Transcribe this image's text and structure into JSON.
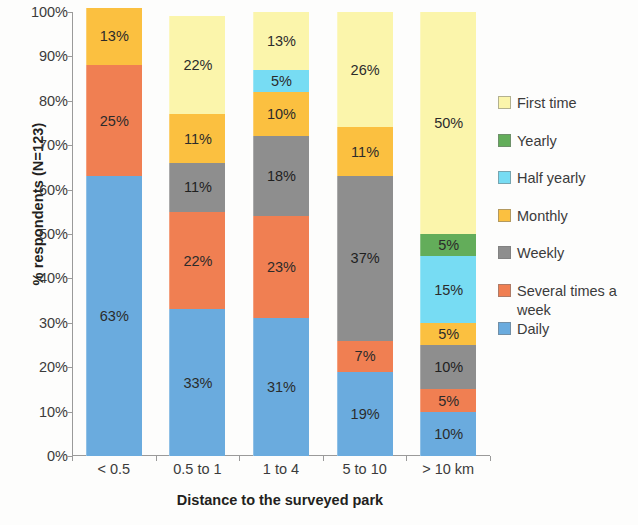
{
  "chart_data": {
    "type": "bar",
    "title": "",
    "subtitle": "",
    "stacked": true,
    "stack_total": 100,
    "xlabel": "Distance to the surveyed park",
    "ylabel": "% respondents (N=123)",
    "categories": [
      "< 0.5",
      "0.5 to 1",
      "1 to 4",
      "5 to 10",
      "> 10 km"
    ],
    "ylim": [
      0,
      100
    ],
    "ytick_labels": [
      "0%",
      "10%",
      "20%",
      "30%",
      "40%",
      "50%",
      "60%",
      "70%",
      "80%",
      "90%",
      "100%"
    ],
    "ytick_values": [
      0,
      10,
      20,
      30,
      40,
      50,
      60,
      70,
      80,
      90,
      100
    ],
    "grid": false,
    "legend_position": "right",
    "value_suffix": "%",
    "series": [
      {
        "name": "Daily",
        "color": "#6aabde",
        "values": [
          63,
          33,
          31,
          19,
          10
        ],
        "labels": [
          "63%",
          "33%",
          "31%",
          "19%",
          "10%"
        ]
      },
      {
        "name": "Several times a week",
        "color": "#f07f52",
        "values": [
          25,
          22,
          23,
          7,
          5
        ],
        "labels": [
          "25%",
          "22%",
          "23%",
          "7%",
          "5%"
        ]
      },
      {
        "name": "Weekly",
        "color": "#8e8e8e",
        "values": [
          0,
          11,
          18,
          37,
          10
        ],
        "labels": [
          "",
          "11%",
          "18%",
          "37%",
          "10%"
        ]
      },
      {
        "name": "Monthly",
        "color": "#fbc040",
        "values": [
          13,
          11,
          10,
          11,
          5
        ],
        "labels": [
          "13%",
          "11%",
          "10%",
          "11%",
          "5%"
        ]
      },
      {
        "name": "Half yearly",
        "color": "#77dcf3",
        "values": [
          0,
          0,
          5,
          0,
          15
        ],
        "labels": [
          "",
          "",
          "5%",
          "",
          "15%"
        ]
      },
      {
        "name": "Yearly",
        "color": "#63ad5a",
        "values": [
          0,
          0,
          0,
          0,
          5
        ],
        "labels": [
          "",
          "",
          "",
          "",
          "5%"
        ]
      },
      {
        "name": "First time",
        "color": "#fbf5ab",
        "values": [
          0,
          22,
          13,
          26,
          50
        ],
        "labels": [
          "",
          "22%",
          "13%",
          "26%",
          "50%"
        ]
      }
    ],
    "legend_order": [
      "First time",
      "Yearly",
      "Half yearly",
      "Monthly",
      "Weekly",
      "Several times a week",
      "Daily"
    ]
  },
  "legend": {
    "items": [
      {
        "label": "First time",
        "color": "#fbf5ab"
      },
      {
        "label": "Yearly",
        "color": "#63ad5a"
      },
      {
        "label": "Half yearly",
        "color": "#77dcf3"
      },
      {
        "label": "Monthly",
        "color": "#fbc040"
      },
      {
        "label": "Weekly",
        "color": "#8e8e8e"
      },
      {
        "label": "Several times a week",
        "color": "#f07f52"
      },
      {
        "label": "Daily",
        "color": "#6aabde"
      }
    ]
  },
  "axes": {
    "y_title": "% respondents (N=123)",
    "x_title": "Distance to the surveyed park"
  }
}
